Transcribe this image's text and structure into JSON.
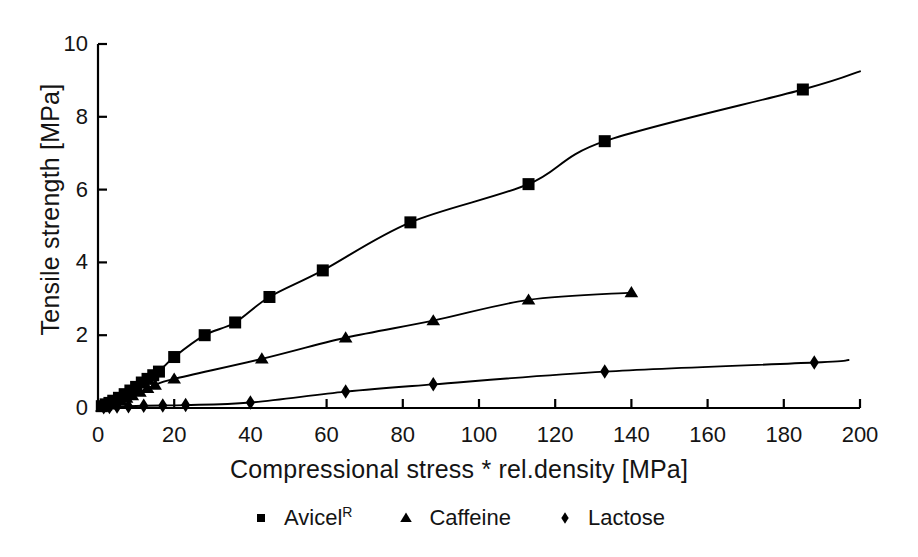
{
  "chart_data": {
    "type": "scatter",
    "title": "",
    "xlabel": "Compressional stress * rel.density [MPa]",
    "ylabel": "Tensile strength [MPa]",
    "xlim": [
      0,
      200
    ],
    "ylim": [
      0,
      10
    ],
    "xticks": [
      0,
      20,
      40,
      60,
      80,
      100,
      120,
      140,
      160,
      180,
      200
    ],
    "yticks": [
      0,
      2,
      4,
      6,
      8,
      10
    ],
    "xtick_labels": [
      "0",
      "20",
      "40",
      "60",
      "80",
      "100",
      "120",
      "140",
      "160",
      "180",
      "200"
    ],
    "ytick_labels": [
      "0",
      "2",
      "4",
      "6",
      "8",
      "10"
    ],
    "grid": false,
    "legend_position": "below",
    "series": [
      {
        "name": "Avicel",
        "name_superscript": "R",
        "marker": "square",
        "color": "#000000",
        "points": [
          [
            1.0,
            0.05
          ],
          [
            2.0,
            0.1
          ],
          [
            3.0,
            0.14
          ],
          [
            4.0,
            0.2
          ],
          [
            5.5,
            0.28
          ],
          [
            7.0,
            0.38
          ],
          [
            8.5,
            0.48
          ],
          [
            10.0,
            0.58
          ],
          [
            11.5,
            0.7
          ],
          [
            13.0,
            0.8
          ],
          [
            14.5,
            0.9
          ],
          [
            16.0,
            1.0
          ],
          [
            20.0,
            1.4
          ],
          [
            28.0,
            2.0
          ],
          [
            36.0,
            2.35
          ],
          [
            45.0,
            3.05
          ],
          [
            59.0,
            3.78
          ],
          [
            82.0,
            5.1
          ],
          [
            113.0,
            6.15
          ],
          [
            133.0,
            7.33
          ],
          [
            185.0,
            8.75
          ]
        ],
        "fit_endpoint": [
          200.0,
          9.25
        ]
      },
      {
        "name": "Caffeine",
        "marker": "triangle",
        "color": "#000000",
        "points": [
          [
            1.0,
            0.03
          ],
          [
            2.0,
            0.06
          ],
          [
            3.0,
            0.09
          ],
          [
            4.5,
            0.14
          ],
          [
            6.0,
            0.2
          ],
          [
            7.5,
            0.27
          ],
          [
            9.0,
            0.34
          ],
          [
            11.0,
            0.44
          ],
          [
            13.0,
            0.54
          ],
          [
            15.0,
            0.63
          ],
          [
            20.0,
            0.8
          ],
          [
            43.0,
            1.35
          ],
          [
            65.0,
            1.93
          ],
          [
            88.0,
            2.4
          ],
          [
            113.0,
            2.97
          ],
          [
            140.0,
            3.17
          ]
        ],
        "fit_endpoint": [
          140.0,
          3.17
        ]
      },
      {
        "name": "Lactose",
        "marker": "diamond",
        "color": "#000000",
        "points": [
          [
            1.5,
            0.02
          ],
          [
            3.0,
            0.03
          ],
          [
            5.0,
            0.04
          ],
          [
            8.0,
            0.05
          ],
          [
            12.0,
            0.06
          ],
          [
            17.0,
            0.07
          ],
          [
            23.0,
            0.08
          ],
          [
            40.0,
            0.15
          ],
          [
            65.0,
            0.45
          ],
          [
            88.0,
            0.65
          ],
          [
            133.0,
            1.0
          ],
          [
            188.0,
            1.25
          ]
        ],
        "fit_endpoint": [
          197.0,
          1.32
        ]
      }
    ]
  },
  "legend": {
    "entries": [
      {
        "label": "Avicel",
        "superscript": "R",
        "marker": "square"
      },
      {
        "label": "Caffeine",
        "superscript": "",
        "marker": "triangle"
      },
      {
        "label": "Lactose",
        "superscript": "",
        "marker": "diamond"
      }
    ]
  },
  "axes": {
    "x_title": "Compressional stress * rel.density [MPa]",
    "y_title": "Tensile strength [MPa]"
  }
}
